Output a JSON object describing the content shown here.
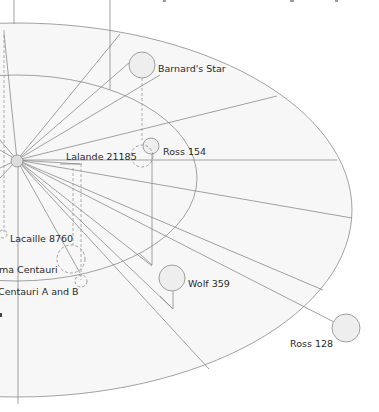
{
  "diagram": {
    "colors": {
      "background": "#ffffff",
      "plane_fill": "#f7f7f7",
      "line": "#8a8a8a",
      "star_fill": "#eeeeee",
      "label": "#2a2a2a"
    },
    "center": {
      "name": "sun",
      "x": 17,
      "y": 160
    },
    "stars": [
      {
        "id": "barnards-star",
        "label": "Barnard's Star",
        "x": 142,
        "y": 65,
        "r": 13
      },
      {
        "id": "ross-154",
        "label": "Ross 154",
        "x": 151,
        "y": 145,
        "r": 8
      },
      {
        "id": "lalande-21185",
        "label": "Lalande 21185",
        "x": 140,
        "y": 156,
        "r": 11
      },
      {
        "id": "lacaille-8760",
        "label": "Lacaille 8760",
        "x": 4,
        "y": 235,
        "r": 4
      },
      {
        "id": "proxima-centauri",
        "label": "ma Centauri",
        "x": 71,
        "y": 259,
        "r": 14
      },
      {
        "id": "alpha-centauri-ab",
        "label": "Centauri A and B",
        "x": 83,
        "y": 282,
        "r": 6
      },
      {
        "id": "wolf-359",
        "label": "Wolf 359",
        "x": 172,
        "y": 278,
        "r": 13
      },
      {
        "id": "ross-128",
        "label": "Ross 128",
        "x": 346,
        "y": 328,
        "r": 14
      }
    ]
  }
}
